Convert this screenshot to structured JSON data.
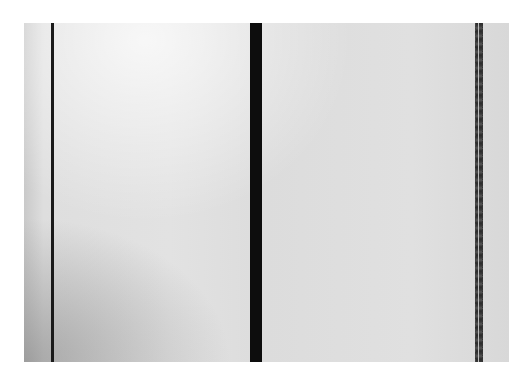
{
  "image": {
    "description": "Black-and-white photograph of an abstract painting: pale grey field divided by vertical stripes",
    "colors": {
      "background": "#ffffff",
      "field": "#dedede",
      "stripe": "#111111"
    },
    "stripes": [
      {
        "name": "left thin line",
        "position": "left"
      },
      {
        "name": "central wide band",
        "position": "center"
      },
      {
        "name": "right ragged double line",
        "position": "right"
      }
    ]
  }
}
